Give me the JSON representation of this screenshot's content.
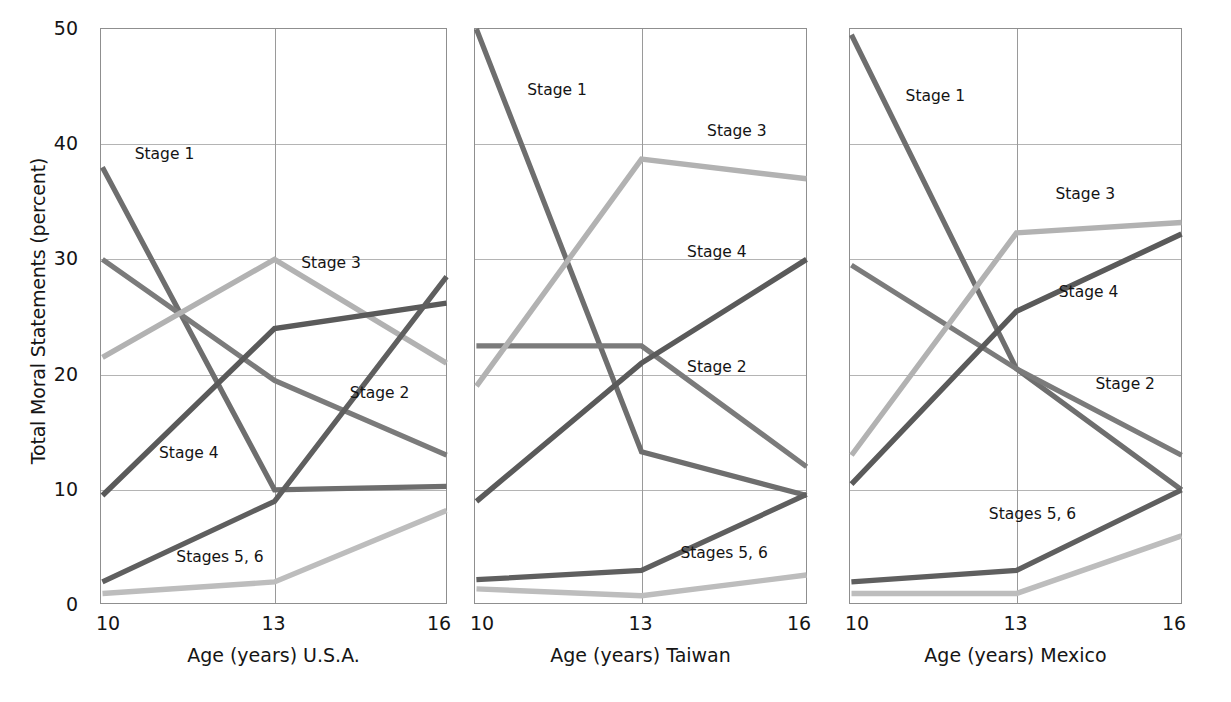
{
  "figure": {
    "y_axis_title": "Total Moral Statements (percent)",
    "y_ticks": [
      "0",
      "10",
      "20",
      "30",
      "40",
      "50"
    ],
    "x_ticks": [
      "10",
      "13",
      "16"
    ]
  },
  "panels": [
    {
      "x_title": "Age (years) U.S.A."
    },
    {
      "x_title": "Age (years) Taiwan"
    },
    {
      "x_title": "Age (years) Mexico"
    }
  ],
  "series_labels": {
    "stage1": "Stage 1",
    "stage2": "Stage 2",
    "stage3": "Stage 3",
    "stage4": "Stage 4",
    "stage56": "Stages 5, 6"
  },
  "colors": {
    "stage1": "#6e6e6e",
    "stage2": "#7b7b7b",
    "stage3": "#b2b2b2",
    "stage4": "#5a5a5a",
    "stage56_dark": "#5f5f5f",
    "stage56_light": "#bdbdbd",
    "axis": "#8f8f8f",
    "grid": "#b4b4b4",
    "text": "#151515"
  },
  "chart_data": [
    {
      "type": "line",
      "title": "U.S.A.",
      "xlabel": "Age (years) U.S.A.",
      "ylabel": "Total Moral Statements (percent)",
      "x": [
        10,
        13,
        16
      ],
      "xlim": [
        10,
        16
      ],
      "ylim": [
        0,
        50
      ],
      "yticks": [
        0,
        10,
        20,
        30,
        40,
        50
      ],
      "grid": true,
      "legend": "inline-annotations",
      "series": [
        {
          "name": "Stage 1",
          "values": [
            38.0,
            10.0,
            10.3
          ]
        },
        {
          "name": "Stage 2",
          "values": [
            30.0,
            19.5,
            13.0
          ]
        },
        {
          "name": "Stage 3",
          "values": [
            21.5,
            30.0,
            21.0
          ]
        },
        {
          "name": "Stage 4",
          "values": [
            9.5,
            24.0,
            26.2
          ]
        },
        {
          "name": "Stages 5, 6 (upper)",
          "values": [
            2.0,
            9.0,
            28.5
          ]
        },
        {
          "name": "Stages 5, 6 (lower)",
          "values": [
            1.0,
            2.0,
            8.2
          ]
        }
      ]
    },
    {
      "type": "line",
      "title": "Taiwan",
      "xlabel": "Age (years) Taiwan",
      "ylabel": "Total Moral Statements (percent)",
      "x": [
        10,
        13,
        16
      ],
      "xlim": [
        10,
        16
      ],
      "ylim": [
        0,
        50
      ],
      "yticks": [
        0,
        10,
        20,
        30,
        40,
        50
      ],
      "grid": true,
      "legend": "inline-annotations",
      "series": [
        {
          "name": "Stage 1",
          "values": [
            50.0,
            13.3,
            9.5
          ]
        },
        {
          "name": "Stage 2",
          "values": [
            22.5,
            22.5,
            12.0
          ]
        },
        {
          "name": "Stage 3",
          "values": [
            19.0,
            38.7,
            37.0
          ]
        },
        {
          "name": "Stage 4",
          "values": [
            9.0,
            21.0,
            30.0
          ]
        },
        {
          "name": "Stages 5, 6 (upper)",
          "values": [
            2.2,
            3.0,
            9.6
          ]
        },
        {
          "name": "Stages 5, 6 (lower)",
          "values": [
            1.4,
            0.8,
            2.6
          ]
        }
      ]
    },
    {
      "type": "line",
      "title": "Mexico",
      "xlabel": "Age (years) Mexico",
      "ylabel": "Total Moral Statements (percent)",
      "x": [
        10,
        13,
        16
      ],
      "xlim": [
        10,
        16
      ],
      "ylim": [
        0,
        50
      ],
      "yticks": [
        0,
        10,
        20,
        30,
        40,
        50
      ],
      "grid": true,
      "legend": "inline-annotations",
      "series": [
        {
          "name": "Stage 1",
          "values": [
            49.5,
            20.5,
            10.0
          ]
        },
        {
          "name": "Stage 2",
          "values": [
            29.5,
            20.5,
            13.0
          ]
        },
        {
          "name": "Stage 3",
          "values": [
            13.0,
            32.3,
            33.2
          ]
        },
        {
          "name": "Stage 4",
          "values": [
            10.5,
            25.5,
            32.2
          ]
        },
        {
          "name": "Stages 5, 6 (upper)",
          "values": [
            2.0,
            3.0,
            10.0
          ]
        },
        {
          "name": "Stages 5, 6 (lower)",
          "values": [
            1.0,
            1.0,
            6.0
          ]
        }
      ]
    }
  ],
  "annotations": [
    {
      "panel": 0,
      "text": "Stage 1",
      "x_pct": 10,
      "y_val": 39.0
    },
    {
      "panel": 0,
      "text": "Stage 3",
      "x_pct": 58,
      "y_val": 29.5
    },
    {
      "panel": 0,
      "text": "Stage 2",
      "x_pct": 72,
      "y_val": 18.2
    },
    {
      "panel": 0,
      "text": "Stage 4",
      "x_pct": 17,
      "y_val": 13.0
    },
    {
      "panel": 0,
      "text": "Stages 5, 6",
      "x_pct": 22,
      "y_val": 4.0
    },
    {
      "panel": 1,
      "text": "Stage 1",
      "x_pct": 16,
      "y_val": 44.5
    },
    {
      "panel": 1,
      "text": "Stage 3",
      "x_pct": 70,
      "y_val": 41.0
    },
    {
      "panel": 1,
      "text": "Stage 4",
      "x_pct": 64,
      "y_val": 30.5
    },
    {
      "panel": 1,
      "text": "Stage 2",
      "x_pct": 64,
      "y_val": 20.5
    },
    {
      "panel": 1,
      "text": "Stages 5, 6",
      "x_pct": 62,
      "y_val": 4.3
    },
    {
      "panel": 2,
      "text": "Stage 1",
      "x_pct": 17,
      "y_val": 44.0
    },
    {
      "panel": 2,
      "text": "Stage 3",
      "x_pct": 62,
      "y_val": 35.5
    },
    {
      "panel": 2,
      "text": "Stage 4",
      "x_pct": 63,
      "y_val": 27.0
    },
    {
      "panel": 2,
      "text": "Stage 2",
      "x_pct": 74,
      "y_val": 19.0
    },
    {
      "panel": 2,
      "text": "Stages 5, 6",
      "x_pct": 42,
      "y_val": 7.7
    }
  ]
}
